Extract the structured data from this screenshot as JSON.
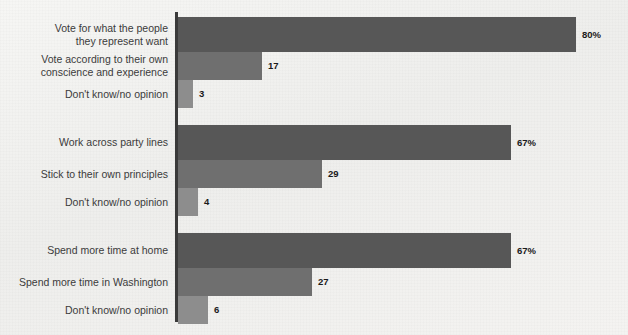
{
  "chart_data": {
    "type": "bar",
    "orientation": "horizontal",
    "title": "",
    "subtitle": "",
    "xlabel": "",
    "ylabel": "",
    "xlim": [
      0,
      90
    ],
    "grid": false,
    "legend": null,
    "axis_line_color": "#3a3a3a",
    "background_color": "#f2f2f0",
    "groups": [
      {
        "id": "group-1",
        "bars": [
          {
            "label": "Vote for what the people\nthey represent want",
            "value": 80,
            "value_label": "80%",
            "color": "#575757",
            "shade": "dark"
          },
          {
            "label": "Vote according to their own\nconscience and experience",
            "value": 17,
            "value_label": "17",
            "color": "#6f6f6f",
            "shade": "medium"
          },
          {
            "label": "Don't know/no opinion",
            "value": 3,
            "value_label": "3",
            "color": "#8d8d8d",
            "shade": "light"
          }
        ]
      },
      {
        "id": "group-2",
        "bars": [
          {
            "label": "Work across party lines",
            "value": 67,
            "value_label": "67%",
            "color": "#575757",
            "shade": "dark"
          },
          {
            "label": "Stick to their own principles",
            "value": 29,
            "value_label": "29",
            "color": "#6f6f6f",
            "shade": "medium"
          },
          {
            "label": "Don't know/no opinion",
            "value": 4,
            "value_label": "4",
            "color": "#8d8d8d",
            "shade": "light"
          }
        ]
      },
      {
        "id": "group-3",
        "bars": [
          {
            "label": "Spend more time at home",
            "value": 67,
            "value_label": "67%",
            "color": "#575757",
            "shade": "dark"
          },
          {
            "label": "Spend more time in Washington",
            "value": 27,
            "value_label": "27",
            "color": "#6f6f6f",
            "shade": "medium"
          },
          {
            "label": "Don't know/no opinion",
            "value": 6,
            "value_label": "6",
            "color": "#8d8d8d",
            "shade": "light"
          }
        ]
      }
    ]
  }
}
